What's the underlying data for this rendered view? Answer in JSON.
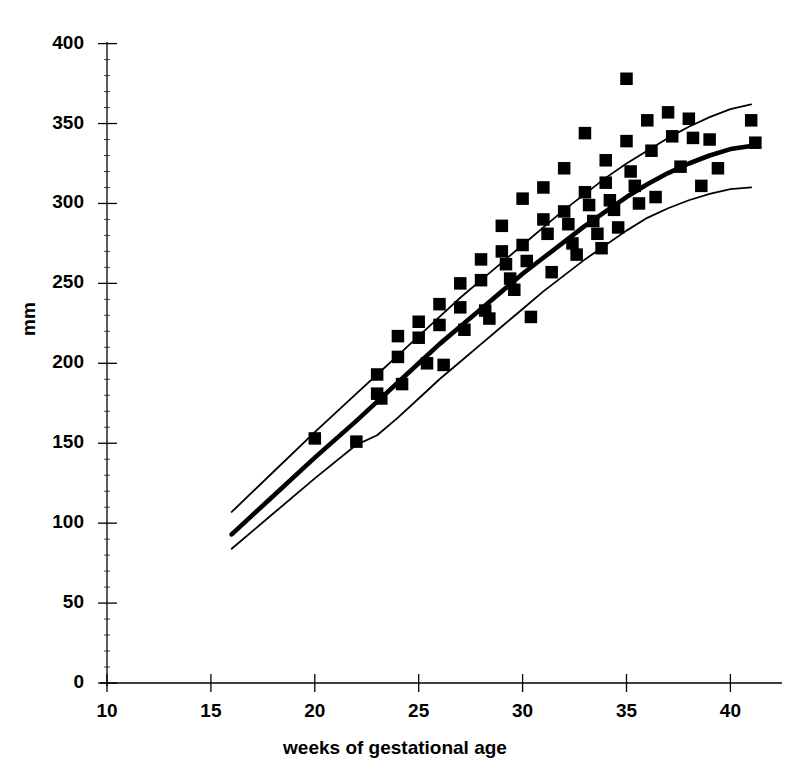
{
  "chart_data": {
    "type": "scatter",
    "title": "",
    "subtitle": "",
    "xlabel": "weeks of gestational age",
    "ylabel": "mm",
    "xlim": [
      10,
      42.8
    ],
    "ylim": [
      0,
      400
    ],
    "xticks": [
      10,
      15,
      20,
      25,
      30,
      35,
      40
    ],
    "yticks": [
      0,
      50,
      100,
      150,
      200,
      250,
      300,
      350,
      400
    ],
    "xtick_labels": [
      "10",
      "15",
      "20",
      "25",
      "30",
      "35",
      "40"
    ],
    "ytick_labels": [
      "0",
      "50",
      "100",
      "150",
      "200",
      "250",
      "300",
      "350",
      "400"
    ],
    "grid": false,
    "legend": "none",
    "marker": "filled-square",
    "marker_color": "#000000",
    "line_color": "#000000",
    "scatter": {
      "name": "measurements",
      "x": [
        20.0,
        22.0,
        23.0,
        23.0,
        23.2,
        24.0,
        24.0,
        24.2,
        25.0,
        25.0,
        25.4,
        26.0,
        26.0,
        26.2,
        27.0,
        27.0,
        27.2,
        28.0,
        28.0,
        28.2,
        28.4,
        29.0,
        29.0,
        29.2,
        29.4,
        29.6,
        30.0,
        30.0,
        30.2,
        30.4,
        31.0,
        31.0,
        31.2,
        31.4,
        32.0,
        32.0,
        32.2,
        32.4,
        32.6,
        33.0,
        33.0,
        33.2,
        33.4,
        33.6,
        33.8,
        34.0,
        34.0,
        34.2,
        34.4,
        34.6,
        35.0,
        35.0,
        35.2,
        35.4,
        35.6,
        36.0,
        36.2,
        36.4,
        37.0,
        37.2,
        37.6,
        38.0,
        38.2,
        38.6,
        39.0,
        39.4,
        41.0,
        41.2
      ],
      "y": [
        153,
        151,
        193,
        181,
        178,
        217,
        204,
        187,
        226,
        216,
        200,
        237,
        224,
        199,
        250,
        235,
        221,
        265,
        252,
        233,
        228,
        286,
        270,
        262,
        253,
        246,
        303,
        274,
        264,
        229,
        310,
        290,
        281,
        257,
        322,
        295,
        287,
        275,
        268,
        344,
        307,
        299,
        289,
        281,
        272,
        327,
        313,
        302,
        296,
        285,
        378,
        339,
        320,
        311,
        300,
        352,
        333,
        304,
        357,
        342,
        323,
        353,
        341,
        311,
        340,
        322,
        352,
        338
      ]
    },
    "curves": [
      {
        "name": "upper-percentile",
        "role": "upper bound",
        "x": [
          16,
          18,
          20,
          22,
          23,
          24,
          25,
          26,
          27,
          28,
          29,
          30,
          31,
          32,
          33,
          34,
          35,
          36,
          37,
          38,
          39,
          40,
          41
        ],
        "y": [
          107,
          132,
          157,
          181,
          193,
          205,
          217,
          229,
          241,
          252,
          263,
          274,
          285,
          296,
          306,
          316,
          325,
          333,
          341,
          348,
          354,
          359,
          362
        ]
      },
      {
        "name": "mean-line",
        "role": "mean",
        "x": [
          16,
          18,
          20,
          22,
          23,
          24,
          25,
          26,
          27,
          28,
          29,
          30,
          31,
          32,
          33,
          34,
          35,
          36,
          37,
          38,
          39,
          40,
          41
        ],
        "y": [
          93,
          117,
          141,
          164,
          176,
          188,
          200,
          212,
          223,
          234,
          245,
          256,
          266,
          276,
          286,
          295,
          304,
          312,
          319,
          325,
          330,
          334,
          336
        ]
      },
      {
        "name": "lower-percentile",
        "role": "lower bound",
        "x": [
          16,
          18,
          20,
          22,
          23,
          24,
          25,
          26,
          27,
          28,
          29,
          30,
          31,
          32,
          33,
          34,
          35,
          36,
          37,
          38,
          39,
          40,
          41
        ],
        "y": [
          84,
          106,
          128,
          149,
          155,
          166,
          178,
          190,
          201,
          212,
          223,
          234,
          245,
          255,
          265,
          274,
          283,
          291,
          297,
          302,
          306,
          309,
          310
        ]
      }
    ]
  },
  "axes": {
    "y_title": "mm",
    "x_title": "weeks of gestational age"
  }
}
